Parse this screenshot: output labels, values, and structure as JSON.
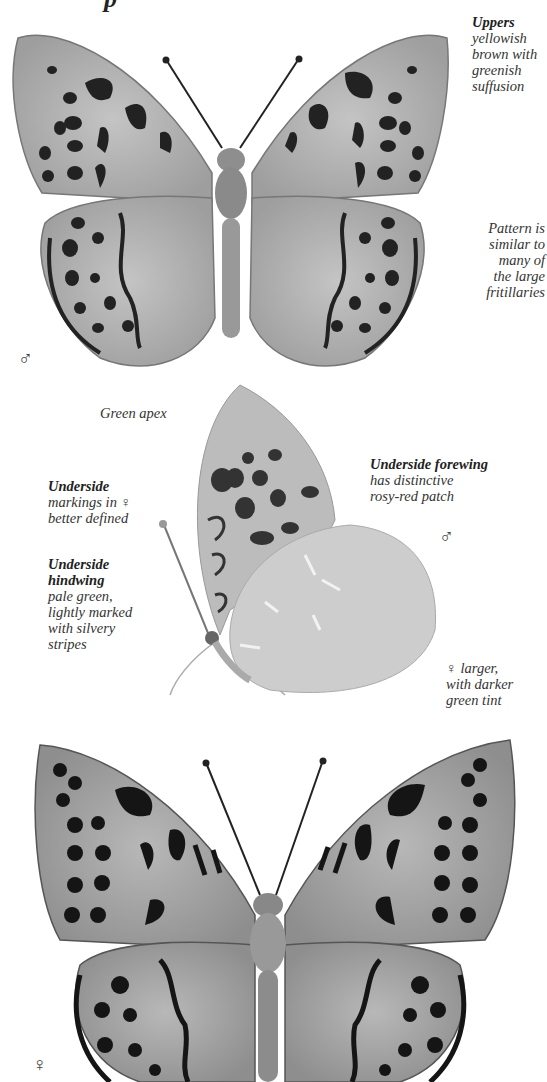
{
  "page": {
    "heading_fragment": "p"
  },
  "top_specimen": {
    "sex_symbol": "♂",
    "annotations": [
      {
        "title": "Uppers",
        "lines": [
          "yellowish",
          "brown with",
          "greenish",
          "suffusion"
        ]
      },
      {
        "title": "",
        "lines": [
          "Pattern is",
          "similar to",
          "many of",
          "the large",
          "fritillaries"
        ]
      }
    ]
  },
  "middle_specimen": {
    "sex_symbol": "♂",
    "annotations": [
      {
        "title": "",
        "lines": [
          "Green apex"
        ]
      },
      {
        "title": "Underside",
        "lines": [
          "markings in ♀",
          "better defined"
        ]
      },
      {
        "title": "Underside hindwing",
        "title_lines": [
          "Underside",
          "hindwing"
        ],
        "lines": [
          "pale green,",
          "lightly marked",
          "with silvery",
          "stripes"
        ]
      },
      {
        "title": "Underside forewing",
        "lines": [
          "has distinctive",
          "rosy-red patch"
        ]
      },
      {
        "title": "",
        "lines": [
          "♀ larger,",
          "with darker",
          "green tint"
        ]
      }
    ]
  },
  "bottom_specimen": {
    "sex_symbol": "♀"
  },
  "colors": {
    "wing_light": "#b4b4b4",
    "wing_mid": "#9a9a9a",
    "markings": "#1e1e1e",
    "underside_pale": "#cfcfcf",
    "text": "#333333"
  }
}
